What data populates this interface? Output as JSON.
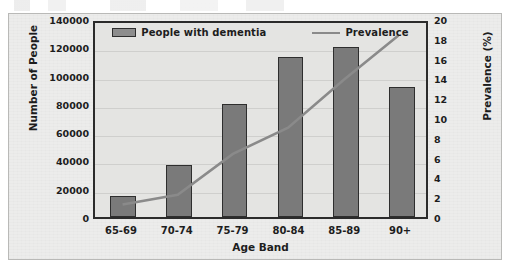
{
  "chart_data": {
    "type": "bar",
    "title": "",
    "subtitle": "",
    "xlabel": "Age Band",
    "ylabel": "Number of People",
    "y2label": "Prevalence (%)",
    "categories": [
      "65-69",
      "70-74",
      "75-79",
      "80-84",
      "85-89",
      "90+"
    ],
    "ylim": [
      0,
      140000
    ],
    "y2lim": [
      0,
      20
    ],
    "yticks": [
      "0",
      "20000",
      "40000",
      "60000",
      "80000",
      "100000",
      "120000",
      "140000"
    ],
    "y2ticks": [
      "0",
      "2",
      "4",
      "6",
      "8",
      "10",
      "12",
      "14",
      "16",
      "18",
      "20"
    ],
    "ytick_values": [
      0,
      20000,
      40000,
      60000,
      80000,
      100000,
      120000,
      140000
    ],
    "y2tick_values": [
      0,
      2,
      4,
      6,
      8,
      10,
      12,
      14,
      16,
      18,
      20
    ],
    "grid": true,
    "legend_position": "top-inside",
    "series": [
      {
        "name": "People with dementia",
        "type": "bar",
        "axis": "left",
        "color": "#7a7a7a",
        "edge_color": "#2e2e2e",
        "values": [
          15000,
          37000,
          80000,
          113000,
          120000,
          92000
        ]
      },
      {
        "name": "Prevalence",
        "type": "line",
        "axis": "right",
        "color": "#8a8a8a",
        "values": [
          1.3,
          2.3,
          6.5,
          9.2,
          14.1,
          18.7
        ]
      }
    ]
  },
  "legend": {
    "entries": [
      {
        "label": "People with dementia",
        "marker": "bar-swatch"
      },
      {
        "label": "Prevalence",
        "marker": "line-swatch"
      }
    ]
  }
}
